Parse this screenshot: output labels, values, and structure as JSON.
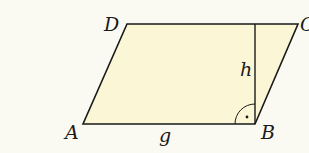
{
  "figure": {
    "type": "parallelogram",
    "vertices": {
      "A": {
        "label": "A",
        "x": 83,
        "y": 124
      },
      "B": {
        "label": "B",
        "x": 255,
        "y": 124
      },
      "C": {
        "label": "C",
        "x": 298,
        "y": 24
      },
      "D": {
        "label": "D",
        "x": 127,
        "y": 24
      }
    },
    "base_label": "g",
    "height_label": "h",
    "right_angle_marker": "B",
    "colors": {
      "background": "#fbfaf2",
      "fill": "#fbf7d6",
      "stroke": "#1a1a1a"
    }
  }
}
